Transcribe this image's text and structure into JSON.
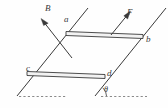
{
  "figure": {
    "background_color": "#fefefe",
    "stroke_color": "#3a3a3a",
    "bar_fill_color": "#f2f2f2",
    "labels": {
      "magnetic_field": "B",
      "force": "F",
      "vertex_a": "a",
      "vertex_b": "b",
      "vertex_c": "c",
      "vertex_d": "d",
      "incline_angle": "θ"
    },
    "geometry": {
      "rail_left": {
        "x1": 17,
        "y1": 96,
        "x2": 88,
        "y2": 8
      },
      "rail_right": {
        "x1": 95,
        "y1": 96,
        "x2": 166,
        "y2": 8
      },
      "rod_ab": {
        "x1": 66,
        "y1": 34,
        "x2": 143,
        "y2": 37
      },
      "rod_cd": {
        "x1": 27,
        "y1": 74,
        "x2": 105,
        "y2": 77
      },
      "field_arrow": {
        "x1": 72,
        "y1": 58,
        "x2": 41,
        "y2": 19
      },
      "force_arrow": {
        "x1": 112,
        "y1": 34,
        "x2": 130,
        "y2": 12
      },
      "dashed_left": {
        "x1": 18,
        "y1": 96,
        "x2": 66,
        "y2": 96
      },
      "dashed_right": {
        "x1": 100,
        "y1": 96,
        "x2": 147,
        "y2": 96
      },
      "angle_arc": {
        "cx": 98,
        "cy": 96,
        "r": 11
      }
    }
  }
}
